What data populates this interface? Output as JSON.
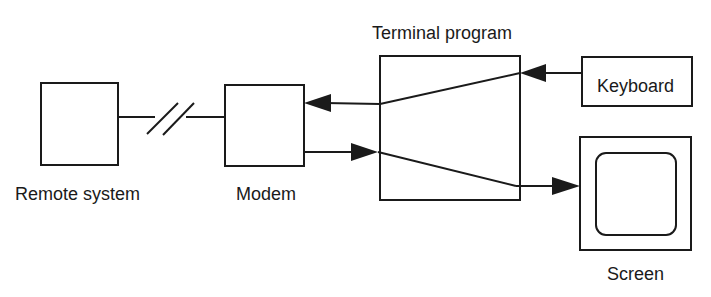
{
  "diagram": {
    "type": "block-diagram",
    "colors": {
      "background": "#ffffff",
      "stroke": "#1a1a1a"
    },
    "nodes": [
      {
        "id": "remote",
        "label": "Remote system"
      },
      {
        "id": "modem",
        "label": "Modem"
      },
      {
        "id": "terminal",
        "label": "Terminal program"
      },
      {
        "id": "keyboard",
        "label": "Keyboard"
      },
      {
        "id": "screen",
        "label": "Screen"
      }
    ],
    "edges": [
      {
        "from": "remote",
        "to": "modem",
        "style": "line-with-break",
        "arrow": false
      },
      {
        "from": "keyboard",
        "to": "terminal",
        "arrow": true
      },
      {
        "from": "terminal",
        "to": "modem",
        "arrow": true
      },
      {
        "from": "modem",
        "to": "terminal",
        "arrow": true
      },
      {
        "from": "terminal",
        "to": "screen",
        "arrow": true
      }
    ]
  }
}
